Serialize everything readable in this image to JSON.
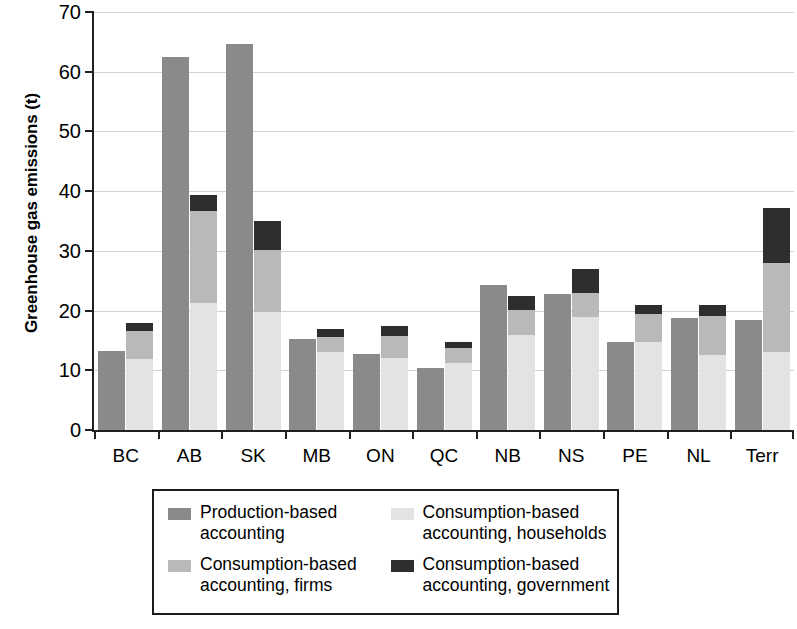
{
  "chart_data": {
    "type": "bar",
    "subtype": "grouped-stacked",
    "title": "",
    "xlabel": "",
    "ylabel": "Greenhouse gas emissions (t)",
    "ylim": [
      0,
      70
    ],
    "ytick_values": [
      0,
      10,
      20,
      30,
      40,
      50,
      60,
      70
    ],
    "ytick_labels": [
      "0",
      "10",
      "20",
      "30",
      "40",
      "50",
      "60",
      "70"
    ],
    "grid": true,
    "grid_axis": "y",
    "legend_position": "below-center",
    "categories": [
      "BC",
      "AB",
      "SK",
      "MB",
      "ON",
      "QC",
      "NB",
      "NS",
      "PE",
      "NL",
      "Terr"
    ],
    "series": [
      {
        "name": "Production-based accounting",
        "key": "production",
        "color": "#8a8a8a",
        "stack": "production",
        "values": [
          13.2,
          62.5,
          64.6,
          15.3,
          12.8,
          10.4,
          24.3,
          22.8,
          14.7,
          18.8,
          18.5
        ]
      },
      {
        "name": "Consumption-based accounting, households",
        "key": "households",
        "color": "#e3e3e3",
        "stack": "consumption",
        "values": [
          11.9,
          21.3,
          19.7,
          13.0,
          12.1,
          11.3,
          15.9,
          18.9,
          14.8,
          12.6,
          13.0
        ]
      },
      {
        "name": "Consumption-based accounting, firms",
        "key": "firms",
        "color": "#b9b9b9",
        "stack": "consumption",
        "values": [
          4.7,
          15.4,
          10.5,
          2.6,
          3.7,
          2.4,
          4.2,
          4.1,
          4.7,
          6.5,
          15.0
        ]
      },
      {
        "name": "Consumption-based accounting, government",
        "key": "government",
        "color": "#2e2e2e",
        "stack": "consumption",
        "values": [
          1.3,
          2.7,
          4.8,
          1.4,
          1.6,
          1.0,
          2.4,
          3.9,
          1.4,
          1.9,
          9.1
        ]
      }
    ],
    "consumption_totals": [
      17.9,
      39.4,
      35.0,
      17.0,
      17.4,
      14.7,
      22.5,
      26.9,
      20.9,
      21.0,
      37.1
    ]
  },
  "legend": {
    "items": [
      {
        "label": "Production-based\naccounting",
        "color": "#8a8a8a",
        "series_key": "production"
      },
      {
        "label": "Consumption-based\naccounting, households",
        "color": "#e3e3e3",
        "series_key": "households"
      },
      {
        "label": "Consumption-based\naccounting, firms",
        "color": "#b9b9b9",
        "series_key": "firms"
      },
      {
        "label": "Consumption-based\naccounting, government",
        "color": "#2e2e2e",
        "series_key": "government"
      }
    ]
  }
}
